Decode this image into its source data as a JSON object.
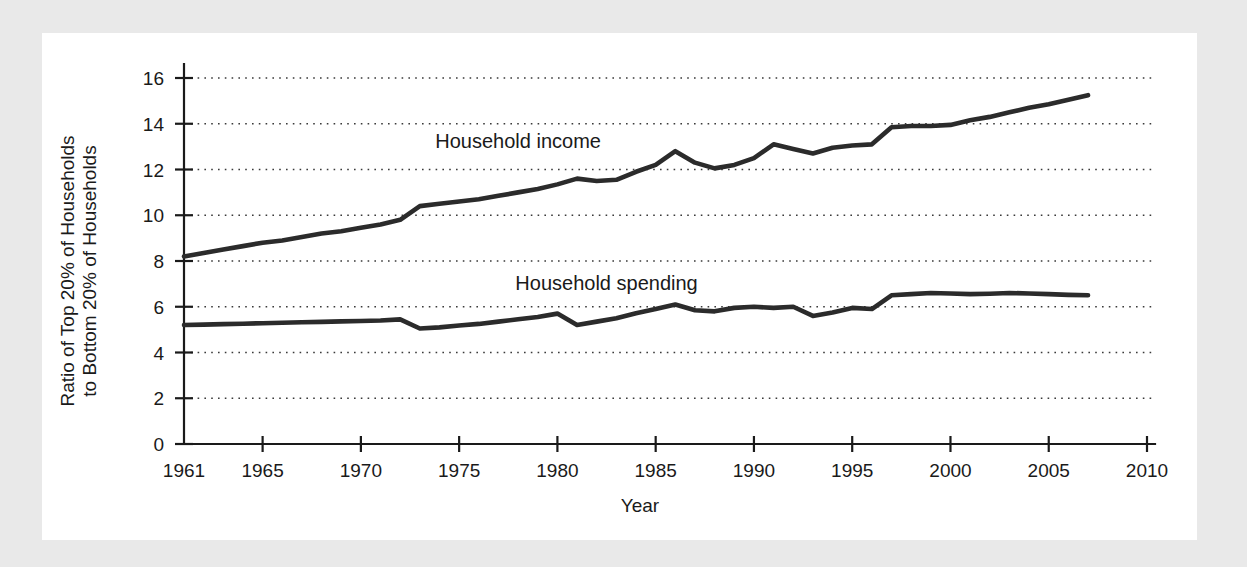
{
  "figure": {
    "background_color": "#e9e9e9",
    "panel_color": "#ffffff",
    "line_color": "#2b2b2b",
    "text_color": "#1a1a1a"
  },
  "chart_data": {
    "type": "line",
    "title": "",
    "subtitle": "",
    "xlabel": "Year",
    "ylabel": "Ratio of Top 20% of Households to Bottom 20% of Households",
    "ylabel_line1": "Ratio of Top 20% of Households",
    "ylabel_line2": "to Bottom 20% of Households",
    "xlim": [
      1961,
      2010
    ],
    "ylim": [
      0,
      16
    ],
    "xticks": [
      1961,
      1965,
      1970,
      1975,
      1980,
      1985,
      1990,
      1995,
      2000,
      2005,
      2010
    ],
    "xtick_labels": [
      "1961",
      "1965",
      "1970",
      "1975",
      "1980",
      "1985",
      "1990",
      "1995",
      "2000",
      "2005",
      "2010"
    ],
    "yticks": [
      0,
      2,
      4,
      6,
      8,
      10,
      12,
      14,
      16
    ],
    "ytick_labels": [
      "0",
      "2",
      "4",
      "6",
      "8",
      "10",
      "12",
      "14",
      "16"
    ],
    "grid": "horizontal-dotted",
    "legend_position": "inline-annotation",
    "x": [
      1961,
      1962,
      1963,
      1964,
      1965,
      1966,
      1967,
      1968,
      1969,
      1970,
      1971,
      1972,
      1973,
      1974,
      1975,
      1976,
      1977,
      1978,
      1979,
      1980,
      1981,
      1982,
      1983,
      1984,
      1985,
      1986,
      1987,
      1988,
      1989,
      1990,
      1991,
      1992,
      1993,
      1994,
      1995,
      1996,
      1997,
      1998,
      1999,
      2000,
      2001,
      2002,
      2003,
      2004,
      2005,
      2006,
      2007
    ],
    "series": [
      {
        "name": "Household income",
        "label": "Household income",
        "label_x": 1978.0,
        "label_y": 12.95,
        "values": [
          8.2,
          8.35,
          8.5,
          8.65,
          8.8,
          8.9,
          9.05,
          9.2,
          9.3,
          9.45,
          9.6,
          9.8,
          10.4,
          10.5,
          10.6,
          10.7,
          10.85,
          11.0,
          11.15,
          11.35,
          11.6,
          11.5,
          11.55,
          11.9,
          12.2,
          12.8,
          12.3,
          12.05,
          12.2,
          12.5,
          13.1,
          12.9,
          12.7,
          12.95,
          13.05,
          13.1,
          13.85,
          13.9,
          13.9,
          13.95,
          14.15,
          14.3,
          14.5,
          14.7,
          14.85,
          15.05,
          15.25
        ]
      },
      {
        "name": "Household spending",
        "label": "Household spending",
        "label_x": 1982.5,
        "label_y": 6.75,
        "values": [
          5.2,
          5.22,
          5.24,
          5.26,
          5.28,
          5.3,
          5.32,
          5.34,
          5.36,
          5.38,
          5.4,
          5.45,
          5.05,
          5.1,
          5.18,
          5.25,
          5.35,
          5.45,
          5.55,
          5.7,
          5.2,
          5.35,
          5.5,
          5.72,
          5.9,
          6.1,
          5.85,
          5.8,
          5.95,
          6.0,
          5.95,
          6.0,
          5.6,
          5.75,
          5.95,
          5.9,
          6.5,
          6.55,
          6.6,
          6.58,
          6.55,
          6.57,
          6.6,
          6.58,
          6.55,
          6.52,
          6.5
        ]
      }
    ]
  }
}
